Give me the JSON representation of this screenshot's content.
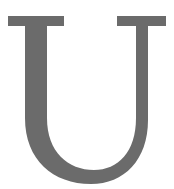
{
  "glyph": {
    "character": "U",
    "style": "serif",
    "fill_color": "#6b6b6b",
    "background_color": "#ffffff"
  }
}
